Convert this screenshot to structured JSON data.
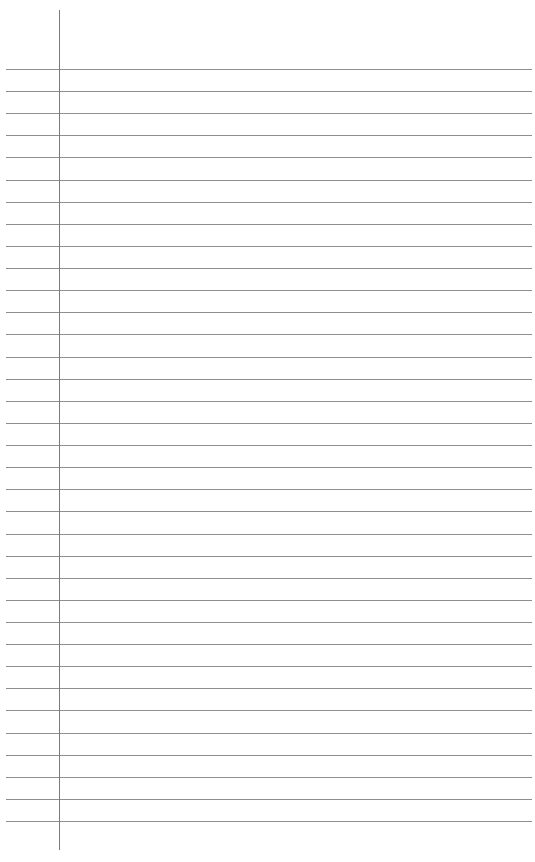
{
  "page": {
    "type": "blank ruled notebook paper",
    "background_color": "#ffffff",
    "rule_color": "#8e8e8e",
    "margin_color": "#7a7a7a",
    "rules": {
      "count": 35,
      "first_y": 69,
      "spacing": 22.12,
      "left": 6,
      "right": 532
    },
    "margin_line": {
      "x": 59,
      "top": 10,
      "bottom": 850
    }
  }
}
